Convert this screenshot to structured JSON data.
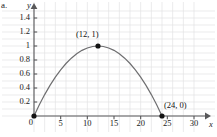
{
  "figure": {
    "part_label": "a.",
    "background_color": "#ffffff",
    "grid_color": "#e2e2e4",
    "axis_color": "#58585a",
    "curve_color": "#6e6e70",
    "point_color": "#141414",
    "text_color": "#1a1a1a"
  },
  "axes": {
    "x_name": "x",
    "y_name": "y",
    "x_ticks": [
      "5",
      "10",
      "15",
      "20",
      "25",
      "30"
    ],
    "x_tick_values": [
      5,
      10,
      15,
      20,
      25,
      30
    ],
    "y_ticks": [
      "0.2",
      "0.4",
      "0.6",
      "0.8",
      "1",
      "1.2",
      "1.4"
    ],
    "y_tick_values": [
      0.2,
      0.4,
      0.6,
      0.8,
      1,
      1.2,
      1.4
    ],
    "origin_label": "0",
    "xlim": [
      0,
      31.5
    ],
    "ylim": [
      0,
      1.5
    ],
    "grid": true
  },
  "chart_data": {
    "type": "line",
    "title": "",
    "subtitle": "",
    "xlabel": "x",
    "ylabel": "y",
    "xlim": [
      0,
      31.5
    ],
    "ylim": [
      0,
      1.5
    ],
    "grid": true,
    "legend": null,
    "x_ticks": [
      5,
      10,
      15,
      20,
      25,
      30
    ],
    "y_ticks": [
      0.2,
      0.4,
      0.6,
      0.8,
      1,
      1.2,
      1.4
    ],
    "series": [
      {
        "name": "parabola",
        "equation": "y = x(24 - x)/144",
        "x": [
          0,
          1,
          2,
          3,
          4,
          5,
          6,
          7,
          8,
          9,
          10,
          11,
          12,
          13,
          14,
          15,
          16,
          17,
          18,
          19,
          20,
          21,
          22,
          23,
          24
        ],
        "y": [
          0,
          0.16,
          0.306,
          0.438,
          0.556,
          0.66,
          0.75,
          0.826,
          0.889,
          0.938,
          0.972,
          0.993,
          1,
          0.993,
          0.972,
          0.938,
          0.889,
          0.826,
          0.75,
          0.66,
          0.556,
          0.438,
          0.306,
          0.16,
          0
        ]
      }
    ],
    "annotations": [
      {
        "label": "(12, 1)",
        "x": 12,
        "y": 1,
        "marker": true
      },
      {
        "label": "(24, 0)",
        "x": 24,
        "y": 0,
        "marker": true
      },
      {
        "label": "",
        "x": 0,
        "y": 0,
        "marker": true
      }
    ]
  }
}
